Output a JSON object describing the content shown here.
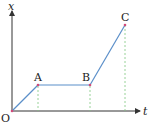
{
  "diagram": {
    "axes": {
      "x_label": "t",
      "y_label": "x",
      "origin_label": "O"
    },
    "points": [
      {
        "label": "O",
        "t": 0,
        "x": 0
      },
      {
        "label": "A",
        "t": 1,
        "x": 1
      },
      {
        "label": "B",
        "t": 3,
        "x": 1
      },
      {
        "label": "C",
        "t": 4.35,
        "x": 3.3
      }
    ],
    "segments": [
      {
        "from": "O",
        "to": "A",
        "description": "uniform motion, positive slope"
      },
      {
        "from": "A",
        "to": "B",
        "description": "at rest, constant position"
      },
      {
        "from": "B",
        "to": "C",
        "description": "uniform motion, steeper positive slope"
      }
    ],
    "colors": {
      "axis": "#333333",
      "line": "#5b8fc9",
      "point": "#d04a7a",
      "dashed": "#7fc77f",
      "text": "#222222"
    }
  }
}
